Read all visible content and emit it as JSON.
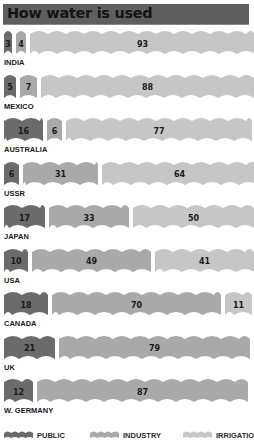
{
  "chart_data": {
    "type": "bar",
    "subtype": "stacked-horizontal-100-percent",
    "title": "How water is used",
    "xlabel": "",
    "ylabel": "",
    "unit": "%",
    "categories": [
      "INDIA",
      "MEXICO",
      "AUSTRALIA",
      "USSR",
      "JAPAN",
      "USA",
      "CANADA",
      "UK",
      "W. GERMANY"
    ],
    "series": [
      {
        "name": "PUBLIC",
        "color": "#6b6b6b",
        "values": [
          3,
          5,
          16,
          6,
          17,
          10,
          18,
          21,
          12
        ]
      },
      {
        "name": "INDUSTRY",
        "color": "#a9a9a9",
        "values": [
          4,
          7,
          6,
          31,
          33,
          49,
          70,
          79,
          87
        ]
      },
      {
        "name": "IRRIGATION",
        "color": "#c6c6c6",
        "values": [
          93,
          88,
          77,
          64,
          50,
          41,
          11,
          1,
          null
        ]
      }
    ],
    "legend_position": "bottom",
    "grid": false
  },
  "title": "How water is used",
  "rows": [
    {
      "country": "INDIA",
      "public": "3",
      "industry": "4",
      "irrigation": "93"
    },
    {
      "country": "MEXICO",
      "public": "5",
      "industry": "7",
      "irrigation": "88"
    },
    {
      "country": "AUSTRALIA",
      "public": "16",
      "industry": "6",
      "irrigation": "77"
    },
    {
      "country": "USSR",
      "public": "6",
      "industry": "31",
      "irrigation": "64"
    },
    {
      "country": "JAPAN",
      "public": "17",
      "industry": "33",
      "irrigation": "50"
    },
    {
      "country": "USA",
      "public": "10",
      "industry": "49",
      "irrigation": "41"
    },
    {
      "country": "CANADA",
      "public": "18",
      "industry": "70",
      "irrigation": "11"
    },
    {
      "country": "UK",
      "public": "21",
      "industry": "79",
      "irrigation": "1"
    },
    {
      "country": "W. GERMANY",
      "public": "12",
      "industry": "87",
      "irrigation": ""
    }
  ],
  "legend": {
    "public": "PUBLIC",
    "industry": "INDUSTRY",
    "irrigation": "IRRIGATION"
  },
  "colors": {
    "title_bg": "#5f5f5f",
    "public": "#6b6b6b",
    "industry": "#a9a9a9",
    "irrigation": "#c6c6c6"
  }
}
